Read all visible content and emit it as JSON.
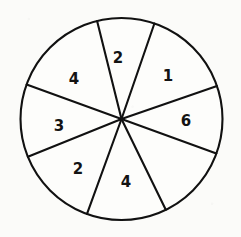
{
  "figure": {
    "name": "spinner-wheel",
    "background_color": "#fbfbf9",
    "ink_color": "#111111"
  },
  "chart_data": {
    "type": "pie",
    "title": "",
    "xlabel": "",
    "ylabel": "",
    "legend": "none",
    "grid": false,
    "center": {
      "x": 121.5,
      "y": 119
    },
    "radius": 101,
    "slice_count": 7,
    "categories": [
      "2",
      "1",
      "6",
      "4",
      "2",
      "3",
      "4"
    ],
    "values": [
      33,
      52,
      39,
      46,
      48,
      38,
      56
    ],
    "slices": [
      {
        "label": "2",
        "start_angle": 71,
        "end_angle": 104,
        "sweep": 33,
        "label_x": 118,
        "label_y": 58
      },
      {
        "label": "1",
        "start_angle": 19,
        "end_angle": 71,
        "sweep": 52,
        "label_x": 168,
        "label_y": 76
      },
      {
        "label": "6",
        "start_angle": -20,
        "end_angle": 19,
        "sweep": 39,
        "label_x": 186,
        "label_y": 121
      },
      {
        "label": "4",
        "start_angle": -64,
        "end_angle": -20,
        "sweep": 44,
        "label_x": 126,
        "label_y": 182
      },
      {
        "label": "2",
        "start_angle": -110,
        "end_angle": -64,
        "sweep": 46,
        "label_x": 78,
        "label_y": 169
      },
      {
        "label": "3",
        "start_angle": -158,
        "end_angle": -110,
        "sweep": 48,
        "label_x": 59,
        "label_y": 126
      },
      {
        "label": "4",
        "start_angle": 160,
        "end_angle": 202,
        "sweep": 56,
        "label_x": 74,
        "label_y": 79
      }
    ]
  }
}
